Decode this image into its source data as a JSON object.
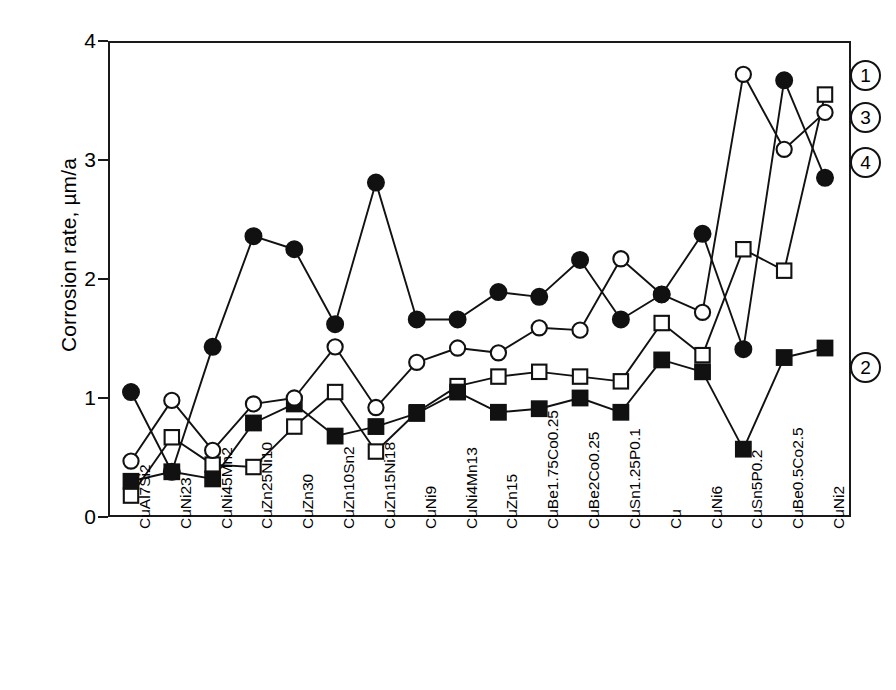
{
  "chart_data": {
    "type": "line",
    "title": "",
    "xlabel": "",
    "ylabel": "Corrosion rate, µm/a",
    "ylim": [
      0,
      4
    ],
    "yticks": [
      "0",
      "1",
      "2",
      "3",
      "4"
    ],
    "grid": false,
    "legend_position": "right-inline-callouts",
    "categories": [
      "CuAl7Si2",
      "CuNi23",
      "CuNi45Mn2",
      "CuZn25Ni10",
      "CuZn30",
      "CuZn10Sn2",
      "CuZn15Ni18",
      "CuNi9",
      "CuNi4Mn13",
      "CuZn15",
      "CuBe1.75Co0.25",
      "CuBe2Co0.25",
      "CuSn1.25P0.1",
      "Cu",
      "CuNi6",
      "CuSn5P0.2",
      "CuBe0.5Co2.5",
      "CuNi2"
    ],
    "series": [
      {
        "name": "1",
        "label": "1",
        "marker": "open-square",
        "values": [
          0.18,
          0.67,
          0.44,
          0.42,
          0.76,
          1.05,
          0.55,
          0.88,
          1.1,
          1.18,
          1.22,
          1.18,
          1.14,
          1.63,
          1.36,
          2.25,
          2.07,
          3.55
        ]
      },
      {
        "name": "2",
        "label": "2",
        "marker": "filled-square",
        "values": [
          0.3,
          0.38,
          0.32,
          0.79,
          0.95,
          0.68,
          0.76,
          0.87,
          1.05,
          0.88,
          0.91,
          1.0,
          0.88,
          1.32,
          1.22,
          0.57,
          1.34,
          1.42
        ]
      },
      {
        "name": "3",
        "label": "3",
        "marker": "open-circle",
        "values": [
          0.47,
          0.98,
          0.56,
          0.95,
          1.0,
          1.43,
          0.92,
          1.3,
          1.42,
          1.38,
          1.59,
          1.57,
          2.17,
          1.87,
          1.72,
          3.72,
          3.09,
          3.4
        ]
      },
      {
        "name": "4",
        "label": "4",
        "marker": "filled-circle",
        "values": [
          1.05,
          0.38,
          1.43,
          2.36,
          2.25,
          1.62,
          2.81,
          1.66,
          1.66,
          1.89,
          1.85,
          2.16,
          1.66,
          1.87,
          2.38,
          1.41,
          3.67,
          2.85
        ]
      }
    ]
  }
}
